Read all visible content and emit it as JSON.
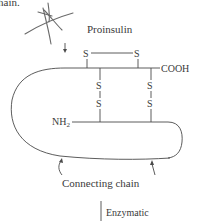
{
  "caption_fragment": "hain.",
  "title": "Proinsulin",
  "labels": {
    "cooh": "COOH",
    "nh2_main": "NH",
    "nh2_sub": "2",
    "sulfur": "S",
    "connecting_chain": "Connecting chain",
    "enzymatic": "Enzymatic"
  },
  "colors": {
    "ink": "#3a3a3a",
    "background": "#ffffff"
  }
}
